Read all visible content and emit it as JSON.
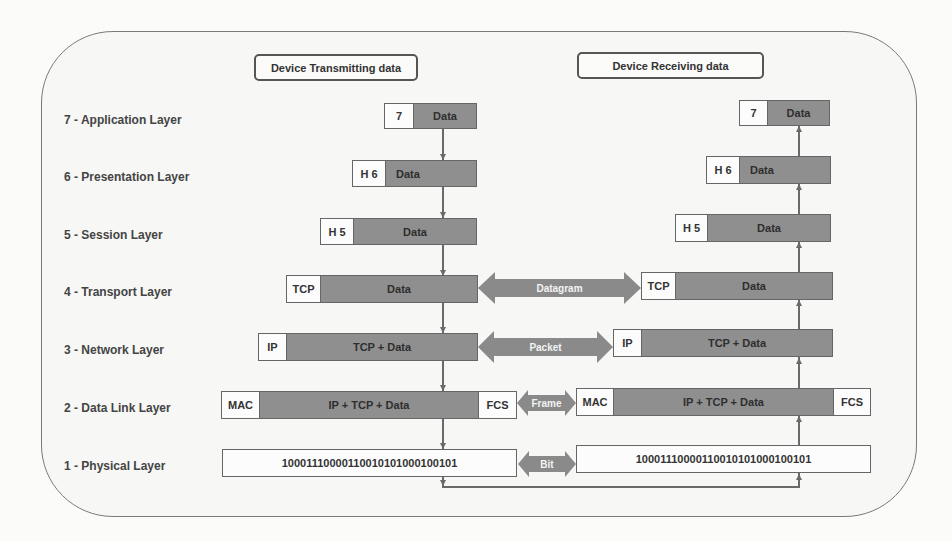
{
  "diagram": {
    "title_transmit": "Device Transmitting data",
    "title_receive": "Device Receiving data",
    "colors": {
      "frame": "#7a7a7a",
      "payload": "#8f8f8f",
      "header": "#fcfcfc",
      "connector": "#8a8a8a"
    },
    "layers": [
      {
        "label": "7 - Application Layer",
        "header": "7",
        "payload": "Data"
      },
      {
        "label": "6 - Presentation Layer",
        "header": "H 6",
        "payload": "Data"
      },
      {
        "label": "5 - Session Layer",
        "header": "H 5",
        "payload": "Data"
      },
      {
        "label": "4 - Transport Layer",
        "header": "TCP",
        "payload": "Data",
        "pdu": "Datagram"
      },
      {
        "label": "3 - Network Layer",
        "header": "IP",
        "payload": "TCP + Data",
        "pdu": "Packet"
      },
      {
        "label": "2 - Data Link Layer",
        "header": "MAC",
        "payload": "IP + TCP + Data",
        "trailer": "FCS",
        "pdu": "Frame"
      },
      {
        "label": "1 - Physical Layer",
        "bits": "10001110000110010101000100101",
        "pdu": "Bit"
      }
    ]
  }
}
